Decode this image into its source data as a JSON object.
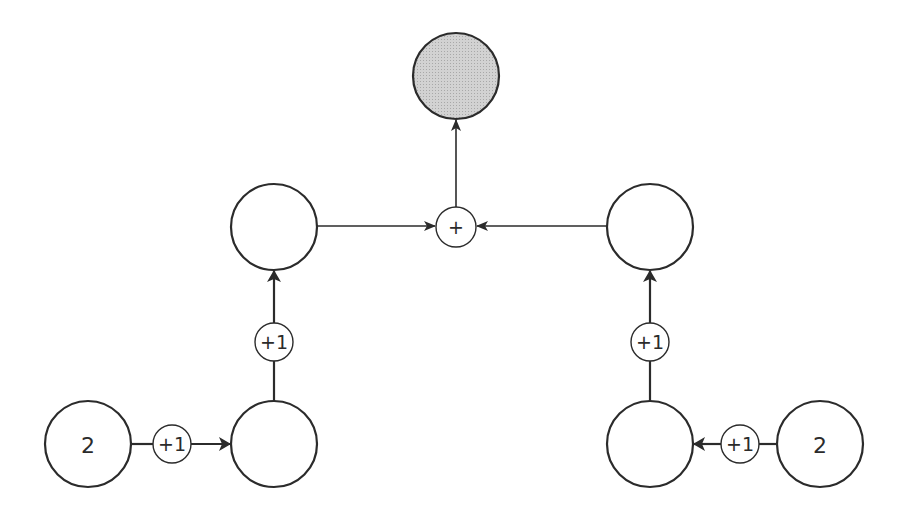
{
  "diagram": {
    "nodes": [
      {
        "id": "output",
        "label": "",
        "shaded": true
      },
      {
        "id": "mid-left",
        "label": "",
        "shaded": false
      },
      {
        "id": "mid-right",
        "label": "",
        "shaded": false
      },
      {
        "id": "bottom-left-inner",
        "label": "",
        "shaded": false
      },
      {
        "id": "bottom-right-inner",
        "label": "",
        "shaded": false
      },
      {
        "id": "bottom-left-input",
        "label": "2",
        "shaded": false
      },
      {
        "id": "bottom-right-input",
        "label": "2",
        "shaded": false
      }
    ],
    "operators": [
      {
        "id": "sum",
        "label": "+"
      },
      {
        "id": "inc-left-vertical",
        "label": "+1"
      },
      {
        "id": "inc-left-horizontal",
        "label": "+1"
      },
      {
        "id": "inc-right-vertical",
        "label": "+1"
      },
      {
        "id": "inc-right-horizontal",
        "label": "+1"
      }
    ],
    "edges": [
      {
        "from": "bottom-left-input",
        "via": "inc-left-horizontal",
        "to": "bottom-left-inner"
      },
      {
        "from": "bottom-left-inner",
        "via": "inc-left-vertical",
        "to": "mid-left"
      },
      {
        "from": "bottom-right-input",
        "via": "inc-right-horizontal",
        "to": "bottom-right-inner"
      },
      {
        "from": "bottom-right-inner",
        "via": "inc-right-vertical",
        "to": "mid-right"
      },
      {
        "from": "mid-left",
        "to": "sum"
      },
      {
        "from": "mid-right",
        "to": "sum"
      },
      {
        "from": "sum",
        "to": "output"
      }
    ]
  }
}
